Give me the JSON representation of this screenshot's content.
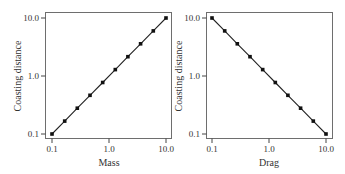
{
  "chart_data": [
    {
      "type": "line",
      "title": "",
      "xlabel": "Mass",
      "ylabel": "Coasting distance",
      "xscale": "log",
      "yscale": "log",
      "xlim": [
        0.1,
        10.0
      ],
      "ylim": [
        0.1,
        10.0
      ],
      "xticks": [
        "0.1",
        "1.0",
        "10.0"
      ],
      "yticks": [
        "0.1",
        "1.0",
        "10.0"
      ],
      "grid": false,
      "legend": null,
      "x": [
        0.1,
        0.167,
        0.278,
        0.464,
        0.774,
        1.29,
        2.15,
        3.59,
        5.99,
        10.0
      ],
      "y": [
        0.1,
        0.167,
        0.278,
        0.464,
        0.774,
        1.29,
        2.15,
        3.59,
        5.99,
        10.0
      ]
    },
    {
      "type": "line",
      "title": "",
      "xlabel": "Drag",
      "ylabel": "Coasting distance",
      "xscale": "log",
      "yscale": "log",
      "xlim": [
        0.1,
        10.0
      ],
      "ylim": [
        0.1,
        10.0
      ],
      "xticks": [
        "0.1",
        "1.0",
        "10.0"
      ],
      "yticks": [
        "0.1",
        "1.0",
        "10.0"
      ],
      "grid": false,
      "legend": null,
      "x": [
        0.1,
        0.167,
        0.278,
        0.464,
        0.774,
        1.29,
        2.15,
        3.59,
        5.99,
        10.0
      ],
      "y": [
        10.0,
        5.99,
        3.59,
        2.15,
        1.29,
        0.774,
        0.464,
        0.278,
        0.167,
        0.1
      ]
    }
  ],
  "panels": [
    {
      "xlabel": "Mass",
      "ylabel": "Coasting distance",
      "xticks": [
        "0.1",
        "1.0",
        "10.0"
      ],
      "yticks": [
        "10.0",
        "1.0",
        "0.1"
      ]
    },
    {
      "xlabel": "Drag",
      "ylabel": "Coasting distance",
      "xticks": [
        "0.1",
        "1.0",
        "10.0"
      ],
      "yticks": [
        "10.0",
        "1.0",
        "0.1"
      ]
    }
  ]
}
